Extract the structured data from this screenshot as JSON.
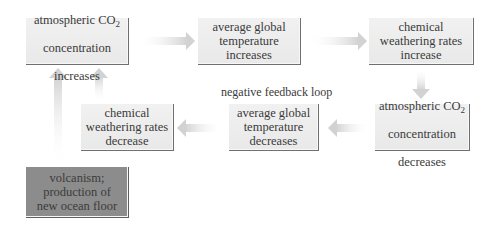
{
  "diagram": {
    "title": "negative feedback loop",
    "nodes": [
      {
        "id": "co2_up",
        "line1": "atmospheric CO",
        "sub": "2",
        "line2": "concentration",
        "line3": "increases"
      },
      {
        "id": "temp_up",
        "text": "average global\ntemperature\nincreases"
      },
      {
        "id": "weather_up",
        "text": "chemical\nweathering rates\nincrease"
      },
      {
        "id": "co2_down",
        "line1": "atmospheric CO",
        "sub": "2",
        "line2": "concentration",
        "line3": "decreases"
      },
      {
        "id": "temp_down",
        "text": "average global\ntemperature\ndecreases"
      },
      {
        "id": "weather_down",
        "text": "chemical\nweathering rates\ndecrease"
      },
      {
        "id": "volcanism",
        "text": "volcanism;\nproduction of\nnew ocean floor"
      }
    ],
    "edges": [
      {
        "from": "co2_up",
        "to": "temp_up",
        "direction": "right"
      },
      {
        "from": "temp_up",
        "to": "weather_up",
        "direction": "right"
      },
      {
        "from": "weather_up",
        "to": "co2_down",
        "direction": "down"
      },
      {
        "from": "co2_down",
        "to": "temp_down",
        "direction": "left"
      },
      {
        "from": "temp_down",
        "to": "weather_down",
        "direction": "left"
      },
      {
        "from": "weather_down",
        "to": "co2_up",
        "direction": "up"
      },
      {
        "from": "volcanism",
        "to": "co2_up",
        "direction": "up"
      }
    ],
    "colors": {
      "box_fill": "#ececec",
      "box_shadow": "#6f6f6f",
      "volcanism_fill": "#8c8c8c",
      "arrow": "#d6d6d6",
      "text": "#3a3a3a"
    }
  }
}
